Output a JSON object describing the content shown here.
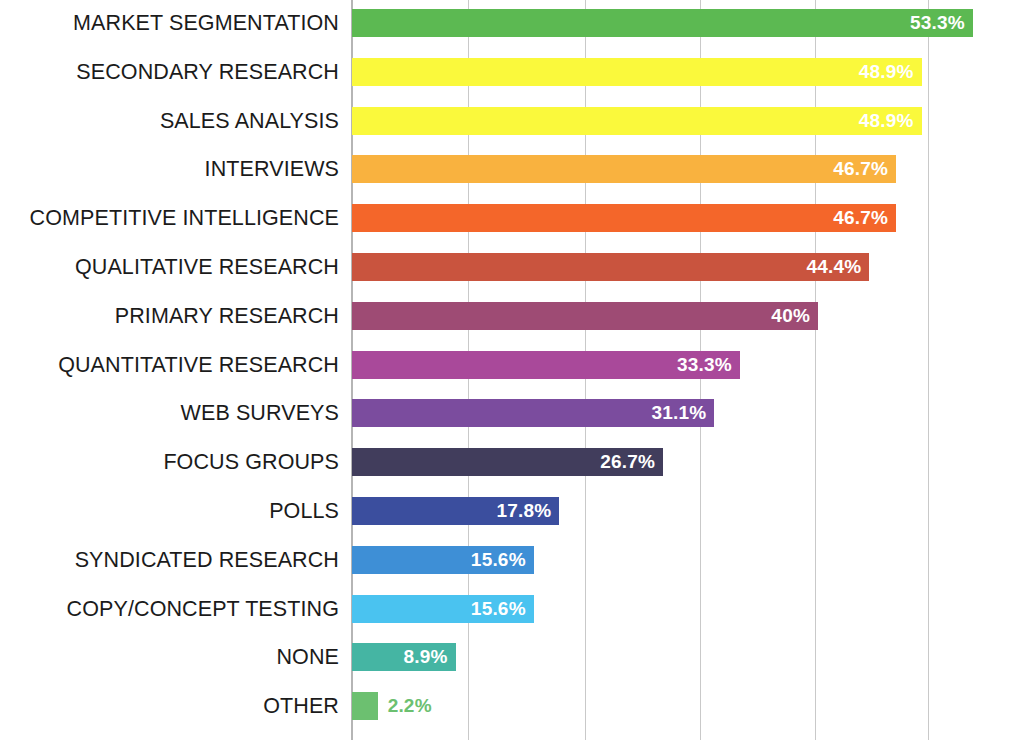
{
  "chart_data": {
    "type": "bar",
    "orientation": "horizontal",
    "title": "",
    "subtitle": "",
    "xlabel": "",
    "ylabel": "",
    "xlim": [
      0,
      60
    ],
    "grid": true,
    "gridlines_x": [
      0,
      10,
      20,
      30,
      40,
      50
    ],
    "legend": "none",
    "value_suffix": "%",
    "categories": [
      "MARKET SEGMENTATION",
      "SECONDARY RESEARCH",
      "SALES ANALYSIS",
      "INTERVIEWS",
      "COMPETITIVE INTELLIGENCE",
      "QUALITATIVE RESEARCH",
      "PRIMARY RESEARCH",
      "QUANTITATIVE RESEARCH",
      "WEB SURVEYS",
      "FOCUS GROUPS",
      "POLLS",
      "SYNDICATED RESEARCH",
      "COPY/CONCEPT TESTING",
      "NONE",
      "OTHER"
    ],
    "values": [
      53.3,
      48.9,
      48.9,
      46.7,
      46.7,
      44.4,
      40,
      33.3,
      31.1,
      26.7,
      17.8,
      15.6,
      15.6,
      8.9,
      2.2
    ],
    "value_labels": [
      "53.3%",
      "48.9%",
      "48.9%",
      "46.7%",
      "46.7%",
      "44.4%",
      "40%",
      "33.3%",
      "31.1%",
      "26.7%",
      "17.8%",
      "15.6%",
      "15.6%",
      "8.9%",
      "2.2%"
    ],
    "label_position": [
      "inside",
      "inside",
      "inside",
      "inside",
      "inside",
      "inside",
      "inside",
      "inside",
      "inside",
      "inside",
      "inside",
      "inside",
      "inside",
      "inside",
      "outside"
    ],
    "colors": [
      "#5CB952",
      "#FAF93C",
      "#FAF93C",
      "#F9B23F",
      "#F4662A",
      "#C9543E",
      "#9E4B74",
      "#A9499A",
      "#7B4C9E",
      "#413D5C",
      "#3B4E9E",
      "#3E8FD6",
      "#4AC3F0",
      "#45B5A3",
      "#6CC070"
    ],
    "label_text_colors": [
      "#ffffff",
      "#ffffff",
      "#ffffff",
      "#ffffff",
      "#ffffff",
      "#ffffff",
      "#ffffff",
      "#ffffff",
      "#ffffff",
      "#ffffff",
      "#ffffff",
      "#ffffff",
      "#ffffff",
      "#ffffff",
      "#6CC070"
    ],
    "gridline_color": "#c9c9c9",
    "axis_color": "#b5b5b5",
    "category_label_color": "#1b1b1b",
    "background_color": "#ffffff"
  }
}
